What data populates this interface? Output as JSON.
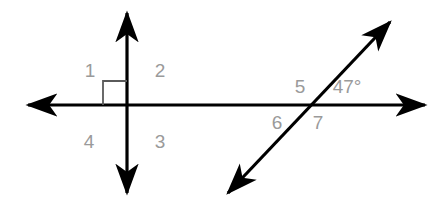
{
  "figure": {
    "type": "geometry-diagram",
    "background_color": "#ffffff",
    "line_color": "#000000",
    "label_color": "#9a9a9a",
    "lines": [
      {
        "name": "horizontal-line",
        "description": "horizontal double-headed arrow line",
        "x1": 28,
        "y1": 105,
        "x2": 425,
        "y2": 105,
        "arrows": "both"
      },
      {
        "name": "vertical-line",
        "description": "vertical double-headed arrow line perpendicular to horizontal line",
        "x1": 127,
        "y1": 13,
        "x2": 127,
        "y2": 193,
        "arrows": "both"
      },
      {
        "name": "transversal-line",
        "description": "diagonal double-headed arrow line crossing the horizontal line",
        "x1": 228,
        "y1": 193,
        "x2": 390,
        "y2": 22,
        "arrows": "both"
      }
    ],
    "intersections": [
      {
        "name": "perpendicular-intersection",
        "x": 127,
        "y": 105
      },
      {
        "name": "transversal-intersection",
        "x": 310,
        "y": 105
      }
    ],
    "right_angle_marker": {
      "name": "right-angle-marker",
      "description": "square marking the 90 degree angle in region 1 (upper left of perpendicular intersection)",
      "x": 103,
      "y": 81,
      "size": 24
    }
  },
  "labels": {
    "angles": [
      {
        "id": "1",
        "text": "1",
        "x": 90,
        "y": 70,
        "region": "upper-left-of-perpendicular"
      },
      {
        "id": "2",
        "text": "2",
        "x": 160,
        "y": 70,
        "region": "upper-right-of-perpendicular"
      },
      {
        "id": "3",
        "text": "3",
        "x": 160,
        "y": 141,
        "region": "lower-right-of-perpendicular"
      },
      {
        "id": "4",
        "text": "4",
        "x": 89,
        "y": 141,
        "region": "lower-left-of-perpendicular"
      },
      {
        "id": "5",
        "text": "5",
        "x": 300,
        "y": 86,
        "region": "upper-left-of-transversal"
      },
      {
        "id": "6",
        "text": "6",
        "x": 277,
        "y": 122,
        "region": "lower-left-of-transversal"
      },
      {
        "id": "7",
        "text": "7",
        "x": 318,
        "y": 122,
        "region": "lower-right-of-transversal"
      }
    ],
    "measures": [
      {
        "id": "angle-measure-47",
        "text": "47°",
        "x": 347,
        "y": 86,
        "region": "upper-right-of-transversal"
      }
    ]
  }
}
